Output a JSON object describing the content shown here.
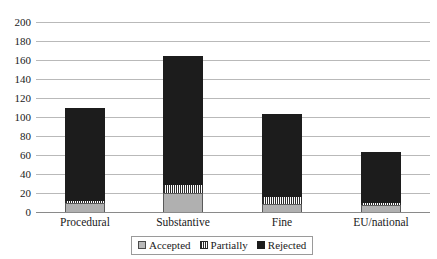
{
  "chart_data": {
    "type": "bar",
    "stacked": true,
    "title": "",
    "subtitle": "",
    "xlabel": "",
    "ylabel": "",
    "ylim": [
      0,
      200
    ],
    "ytick_step": 20,
    "yticks": [
      0,
      20,
      40,
      60,
      80,
      100,
      120,
      140,
      160,
      180,
      200
    ],
    "ytick_labels": [
      "0",
      "20",
      "40",
      "60",
      "80",
      "100",
      "120",
      "140",
      "160",
      "180",
      "200"
    ],
    "grid": "horizontal",
    "legend_position": "bottom",
    "categories": [
      "Procedural",
      "Substantive",
      "Fine",
      "EU/national"
    ],
    "series": [
      {
        "name": "Accepted",
        "color": "#b0b0b0",
        "pattern": "solid-light-grey",
        "values": [
          10,
          20,
          8,
          7
        ]
      },
      {
        "name": "Partially",
        "color": "#ffffff",
        "pattern": "fine-vertical-hatch",
        "values": [
          2,
          8,
          8,
          3
        ]
      },
      {
        "name": "Rejected",
        "color": "#1c1c1c",
        "pattern": "solid-black",
        "values": [
          98,
          136,
          87,
          53
        ]
      }
    ],
    "totals": [
      110,
      164,
      103,
      63
    ]
  },
  "legend": {
    "items": [
      {
        "label": "Accepted",
        "swatch": "accepted-swatch-icon"
      },
      {
        "label": "Partially",
        "swatch": "partially-swatch-icon"
      },
      {
        "label": "Rejected",
        "swatch": "rejected-swatch-icon"
      }
    ]
  }
}
